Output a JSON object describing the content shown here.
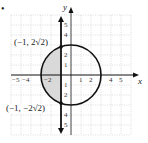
{
  "figure": {
    "marker": "•",
    "axes": {
      "x_label": "x",
      "y_label": "y"
    },
    "x_ticks": [
      "−5",
      "−4",
      "−2",
      "1",
      "2",
      "4",
      "5"
    ],
    "y_ticks_top": [
      "5",
      "4",
      "2",
      "1"
    ],
    "y_ticks_bottom": [
      "1",
      "2",
      "4",
      "5"
    ],
    "point_labels": {
      "top": "(−1, 2√2)",
      "bottom": "(−1, −2√2)"
    },
    "curve": "circle x² + y² = 9",
    "vertical_line": "x = −1",
    "shaded_region": "circle interior left of x = −1",
    "colors": {
      "shade": "#d9d9d9",
      "grid": "#cfcfcf",
      "ink": "#111111"
    }
  }
}
